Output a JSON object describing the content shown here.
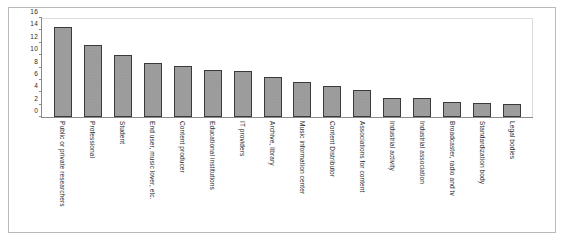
{
  "chart_data": {
    "type": "bar",
    "title": "",
    "subtitle": "",
    "xlabel": "",
    "ylabel": "",
    "ylim": [
      0,
      16
    ],
    "ytick_step": 2,
    "yticks": [
      "0",
      "2",
      "4",
      "6",
      "8",
      "10",
      "12",
      "14",
      "16"
    ],
    "grid": false,
    "legend": false,
    "legend_position": "none",
    "bar_color": "#9c9c9c",
    "bar_edge_color": "#3a3a3a",
    "axis_color": "#8a8a8a",
    "background_color": "#ffffff",
    "x_label_rotation": 90,
    "categories": [
      "Public or private researchers",
      "Professional",
      "Student",
      "End user, music lover, etc.",
      "Content producer",
      "Educational institutions",
      "IT providers",
      "Archive, library",
      "Music information center",
      "Content Distributor",
      "Associations for content",
      "Industrial activity",
      "Industrial association",
      "Broadcaster, radio and tv",
      "Standardization body",
      "Legal bodies"
    ],
    "values": [
      14.5,
      11.7,
      10.1,
      8.7,
      8.2,
      7.6,
      7.4,
      6.5,
      5.7,
      5.0,
      4.4,
      3.1,
      3.0,
      2.5,
      2.2,
      2.1
    ]
  }
}
